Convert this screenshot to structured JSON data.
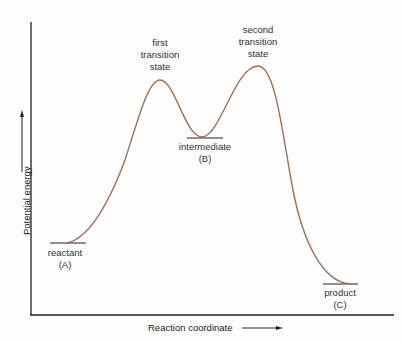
{
  "diagram": {
    "type": "reaction-energy-profile",
    "axes": {
      "x_label": "Reaction coordinate",
      "y_label": "Potential energy"
    },
    "points": [
      {
        "id": "reactant",
        "label_line1": "reactant",
        "label_line2": "(A)"
      },
      {
        "id": "first_ts",
        "label_line1": "first",
        "label_line2": "transition",
        "label_line3": "state"
      },
      {
        "id": "intermediate",
        "label_line1": "intermediate",
        "label_line2": "(B)"
      },
      {
        "id": "second_ts",
        "label_line1": "second",
        "label_line2": "transition",
        "label_line3": "state"
      },
      {
        "id": "product",
        "label_line1": "product",
        "label_line2": "(C)"
      }
    ],
    "colors": {
      "curve": "#a0705a",
      "axes": "#222222",
      "levels": "#222222"
    }
  }
}
